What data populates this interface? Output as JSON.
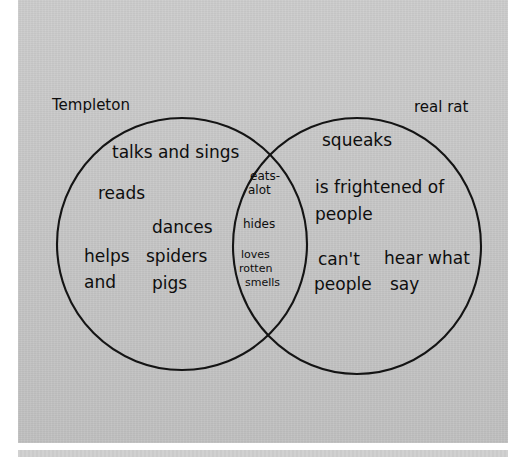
{
  "document": {
    "type": "hand-drawn venn diagram",
    "title": "Templeton vs real rat Venn diagram"
  },
  "diagram": {
    "left_label": "Templeton",
    "right_label": "real rat",
    "left_only": [
      {
        "text": "talks and sings"
      },
      {
        "text": "reads"
      },
      {
        "text": "dances"
      },
      {
        "text": "helps"
      },
      {
        "text": "and"
      },
      {
        "text": "spiders"
      },
      {
        "text": "pigs"
      }
    ],
    "overlap": [
      {
        "line1": "eats-",
        "line2": "alot"
      },
      {
        "line1": "hides"
      },
      {
        "line1": "loves",
        "line2": "rotten",
        "line3": "smells"
      }
    ],
    "right_only": [
      {
        "text": "squeaks"
      },
      {
        "text": "is frightened of"
      },
      {
        "text": "people"
      },
      {
        "text": "can't"
      },
      {
        "text": "people"
      },
      {
        "text": "hear what"
      },
      {
        "text": "say"
      }
    ],
    "colors": {
      "ink": "#141414",
      "paper": "#c9c9c9",
      "page_background": "#ffffff"
    }
  }
}
